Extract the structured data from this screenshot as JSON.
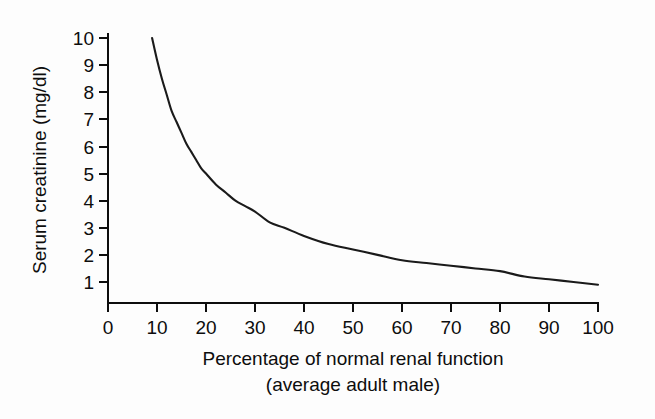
{
  "chart_data": {
    "type": "line",
    "title": "",
    "xlabel": "Percentage of normal renal function",
    "xlabel_line2": "(average adult male)",
    "ylabel": "Serum creatinine (mg/dl)",
    "xlim": [
      0,
      100
    ],
    "ylim": [
      0,
      10
    ],
    "grid": false,
    "legend": null,
    "xticks": [
      0,
      10,
      20,
      30,
      40,
      50,
      60,
      70,
      80,
      90,
      100
    ],
    "xtick_labels": [
      "0",
      "10",
      "20",
      "30",
      "40",
      "50",
      "60",
      "70",
      "80",
      "90",
      "100"
    ],
    "yticks": [
      1,
      2,
      3,
      4,
      5,
      6,
      7,
      8,
      9,
      10
    ],
    "ytick_labels": [
      "1",
      "2",
      "3",
      "4",
      "5",
      "6",
      "7",
      "8",
      "9",
      "10"
    ],
    "series": [
      {
        "name": "Serum creatinine",
        "color": "#1a1a1a",
        "x": [
          9,
          10,
          11,
          12,
          13,
          14,
          15,
          16,
          17,
          18,
          19,
          20,
          22,
          24,
          26,
          28,
          30,
          33,
          36,
          40,
          45,
          50,
          55,
          60,
          65,
          70,
          75,
          80,
          85,
          90,
          95,
          100
        ],
        "y": [
          10.0,
          9.2,
          8.5,
          7.9,
          7.3,
          6.9,
          6.5,
          6.1,
          5.8,
          5.5,
          5.2,
          5.0,
          4.6,
          4.3,
          4.0,
          3.8,
          3.6,
          3.2,
          3.0,
          2.7,
          2.4,
          2.2,
          2.0,
          1.8,
          1.7,
          1.6,
          1.5,
          1.4,
          1.2,
          1.1,
          1.0,
          0.9
        ]
      }
    ],
    "relationship": "inverse hyperbolic: serum creatinine is approximately inversely proportional to percentage of normal renal function"
  },
  "axes": {
    "y_title": "Serum creatinine (mg/dl)",
    "x_title_line1": "Percentage of normal renal function",
    "x_title_line2": "(average adult male)"
  },
  "ticks": {
    "x": [
      "0",
      "10",
      "20",
      "30",
      "40",
      "50",
      "60",
      "70",
      "80",
      "90",
      "100"
    ],
    "y": [
      "10",
      "9",
      "8",
      "7",
      "6",
      "5",
      "4",
      "3",
      "2",
      "1"
    ]
  },
  "colors": {
    "curve": "#1a1a1a",
    "axis": "#0d0d0d",
    "background": "#fdfdfd"
  }
}
